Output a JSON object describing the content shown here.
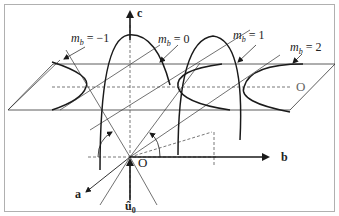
{
  "diagram": {
    "axes": {
      "c": "c",
      "b": "b",
      "a": "a",
      "u0": "û",
      "u0_sub": "0",
      "origin": "O",
      "plane_origin": "O"
    },
    "curves": [
      {
        "m": "m",
        "sub": "b",
        "eq": " = −1"
      },
      {
        "m": "m",
        "sub": "b",
        "eq": " = 0"
      },
      {
        "m": "m",
        "sub": "b",
        "eq": " = 1"
      },
      {
        "m": "m",
        "sub": "b",
        "eq": " = 2"
      }
    ],
    "colors": {
      "line": "#1a1a1a",
      "thin": "#333333",
      "dash": "#555555",
      "border": "#b0b0b0"
    }
  }
}
